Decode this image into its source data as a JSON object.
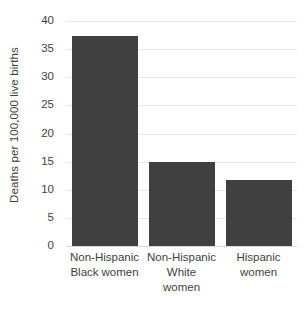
{
  "chart_data": {
    "type": "bar",
    "title": "",
    "xlabel": "",
    "ylabel": "Deaths per 100,000 live births",
    "categories": [
      "Non-Hispanic Black women",
      "Non-Hispanic White women",
      "Hispanic women"
    ],
    "category_lines": [
      [
        "Non-Hispanic",
        "Black women"
      ],
      [
        "Non-Hispanic",
        "White",
        "women"
      ],
      [
        "Hispanic",
        "women"
      ]
    ],
    "values": [
      37.3,
      14.9,
      11.8
    ],
    "ylim": [
      0,
      40
    ],
    "ytick_step": 5,
    "ytick_labels": [
      "40",
      "35",
      "30",
      "25",
      "20",
      "15",
      "10",
      "5",
      "0"
    ],
    "ytick_values": [
      40,
      35,
      30,
      25,
      20,
      15,
      10,
      5,
      0
    ],
    "grid": true,
    "grid_axis": "y",
    "legend": false,
    "legend_position": "none",
    "bar_color": "#404040",
    "gridline_color": "#e6e6e6",
    "text_color": "#3f3f3f",
    "background_color": "#ffffff"
  }
}
